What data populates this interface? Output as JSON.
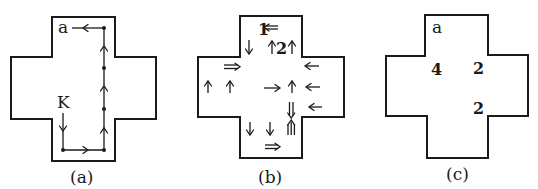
{
  "figure": {
    "panels": [
      {
        "id": "a",
        "caption": "(a)",
        "labels": {
          "start": "K",
          "end": "a"
        },
        "path_description": "K down, right along bottom, up right column through 3 nodes, left to a"
      },
      {
        "id": "b",
        "caption": "(b)",
        "labels": {
          "top_left_num": "1",
          "top_mid_num": "2"
        }
      },
      {
        "id": "c",
        "caption": "(c)",
        "labels": {
          "corner": "a",
          "left_value": "4",
          "right_top_value": "2",
          "right_bottom_value": "2"
        }
      }
    ],
    "colors": {
      "ink": "#1a1a1a",
      "background": "#ffffff"
    }
  }
}
